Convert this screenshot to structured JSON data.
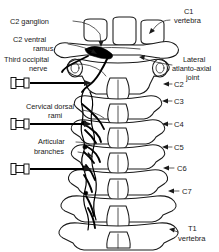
{
  "figure": {
    "background_color": "#ffffff",
    "line_color": "#1a1a1a",
    "nerve_color": "#000000",
    "width": 219,
    "height": 252
  },
  "labels_left": [
    {
      "id": "c2-ganglion",
      "text": "C2 ganglion",
      "lines": [
        "C2 ganglion"
      ],
      "x": 10,
      "y": 24
    },
    {
      "id": "c2-ventral-ramus",
      "text": "C2 ventral ramus",
      "lines": [
        "C2 ventral",
        "ramus"
      ],
      "x": 12,
      "y": 42
    },
    {
      "id": "third-occipital-nerve",
      "text": "Third occipital nerve",
      "lines": [
        "Third occipital",
        "nerve"
      ],
      "x": 4,
      "y": 61
    },
    {
      "id": "cervical-dorsal-rami",
      "text": "Cervical dorsal rami",
      "lines": [
        "Cervical dorsal",
        "rami"
      ],
      "x": 26,
      "y": 108
    },
    {
      "id": "articular-branches",
      "text": "Articular branches",
      "lines": [
        "Articular",
        "branches"
      ],
      "x": 40,
      "y": 143
    }
  ],
  "labels_right": [
    {
      "id": "c1-vertebra",
      "text": "C1 vertebra",
      "lines": [
        "C1",
        "vertebra"
      ],
      "x": 172,
      "y": 12
    },
    {
      "id": "lateral-atlanto-axial-joint",
      "text": "Lateral atlanto-axial joint",
      "lines": [
        "Lateral",
        "atlanto-axial",
        "joint"
      ],
      "x": 172,
      "y": 62
    }
  ],
  "vertebra_levels": [
    {
      "id": "level-c2",
      "label": "C2",
      "x": 173,
      "y": 86
    },
    {
      "id": "level-c3",
      "label": "C3",
      "x": 173,
      "y": 103
    },
    {
      "id": "level-c4",
      "label": "C4",
      "x": 173,
      "y": 126
    },
    {
      "id": "level-c5",
      "label": "C5",
      "x": 173,
      "y": 149
    },
    {
      "id": "level-c6",
      "label": "C6",
      "x": 175,
      "y": 170
    },
    {
      "id": "level-c7",
      "label": "C7",
      "x": 180,
      "y": 192
    },
    {
      "id": "level-t1",
      "label": "T1 vertebra",
      "lines": [
        "T1",
        "vertebra"
      ],
      "x": 180,
      "y": 228
    }
  ],
  "needles": [
    {
      "id": "needle-third-occipital-nerve",
      "y": 83,
      "hub_x": 12,
      "tip_x": 82
    },
    {
      "id": "needle-cervical-dorsal-rami",
      "y": 124,
      "hub_x": 12,
      "tip_x": 82
    },
    {
      "id": "needle-lower-cervical",
      "y": 169,
      "hub_x": 12,
      "tip_x": 82
    }
  ],
  "structures": {
    "atlas": "C1 atlas with transverse processes",
    "ganglion": "C2 dorsal root ganglion shown in solid black",
    "nerves": "Cervical dorsal rami and articular branches shown as dark curved lines"
  }
}
